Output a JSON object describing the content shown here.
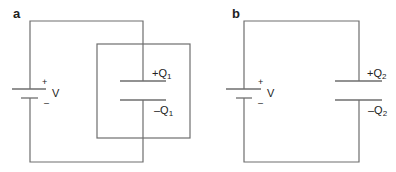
{
  "panels": [
    {
      "label": "a",
      "battery": {
        "plus": "+",
        "minus": "–",
        "voltage": "V"
      },
      "capacitor": {
        "top_charge": "+Q",
        "top_sub": "1",
        "bottom_charge": "–Q",
        "bottom_sub": "1"
      },
      "has_enclosing_box": true
    },
    {
      "label": "b",
      "battery": {
        "plus": "+",
        "minus": "–",
        "voltage": "V"
      },
      "capacitor": {
        "top_charge": "+Q",
        "top_sub": "2",
        "bottom_charge": "–Q",
        "bottom_sub": "2"
      },
      "has_enclosing_box": false
    }
  ],
  "colors": {
    "line": "#6e6e6e",
    "text": "#222222"
  }
}
